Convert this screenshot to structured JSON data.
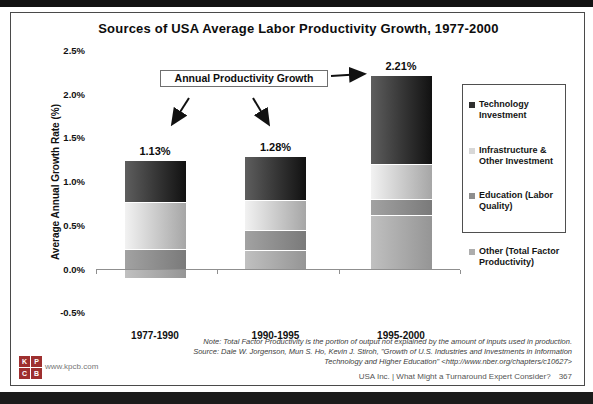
{
  "slide": {
    "title": "Sources of USA Average Labor Productivity Growth, 1977-2000",
    "callout_label": "Annual Productivity Growth",
    "notes": [
      "Note: Total Factor Productivity is the portion of output not explained by the amount of inputs used in production.",
      "Source: Dale W. Jorgenson, Mun S. Ho, Kevin J. Stiroh, \"Growth of U.S. Industries and Investments in Information",
      "Technology and Higher Education\" <http://www.nber.org/chapters/c10627>"
    ],
    "footer_right": "USA Inc. | What Might a Turnaround Expert Consider?",
    "page_number": "367",
    "kpcb_url": "www.kpcb.com",
    "logo_letters": [
      "K",
      "P",
      "C",
      "B"
    ],
    "logo_color": "#9e2f2f"
  },
  "chart_data": {
    "type": "bar",
    "stacked": true,
    "title": "Sources of USA Average Labor Productivity Growth, 1977-2000",
    "xlabel": "",
    "ylabel": "Average Annual Growth Rate (%)",
    "ylim": [
      -0.5,
      2.5
    ],
    "grid": false,
    "legend_position": "right",
    "ytick_labels": [
      "2.5%",
      "2.0%",
      "1.5%",
      "1.0%",
      "0.5%",
      "0.0%",
      "-0.5%"
    ],
    "ytick_values": [
      2.5,
      2.0,
      1.5,
      1.0,
      0.5,
      0.0,
      -0.5
    ],
    "categories": [
      "1977-1990",
      "1990-1995",
      "1995-2000"
    ],
    "totals": [
      1.13,
      1.28,
      2.21
    ],
    "totals_labels": [
      "1.13%",
      "1.28%",
      "2.21%"
    ],
    "series": [
      {
        "name": "Other (Total Factor Productivity)",
        "values": [
          -0.1,
          0.22,
          0.62
        ],
        "color_left": "#c0c0c0",
        "color_right": "#959595",
        "legend_color": "#adadad"
      },
      {
        "name": "Education (Labor Quality)",
        "values": [
          0.23,
          0.23,
          0.18
        ],
        "color_left": "#a2a2a2",
        "color_right": "#7a7a7a",
        "legend_color": "#8e8e8e"
      },
      {
        "name": "Infrastructure & Other Investment",
        "values": [
          0.54,
          0.34,
          0.4
        ],
        "color_left": "#f2f2f2",
        "color_right": "#a6a6a6",
        "legend_color": "#d8d8d8"
      },
      {
        "name": "Technology Investment",
        "values": [
          0.46,
          0.49,
          1.01
        ],
        "color_left": "#5e5e5e",
        "color_right": "#111111",
        "legend_color": "#2f2f2f"
      }
    ],
    "legend_order_top_to_bottom": [
      "Technology Investment",
      "Infrastructure & Other Investment",
      "Education (Labor Quality)",
      "Other (Total Factor Productivity)"
    ]
  }
}
